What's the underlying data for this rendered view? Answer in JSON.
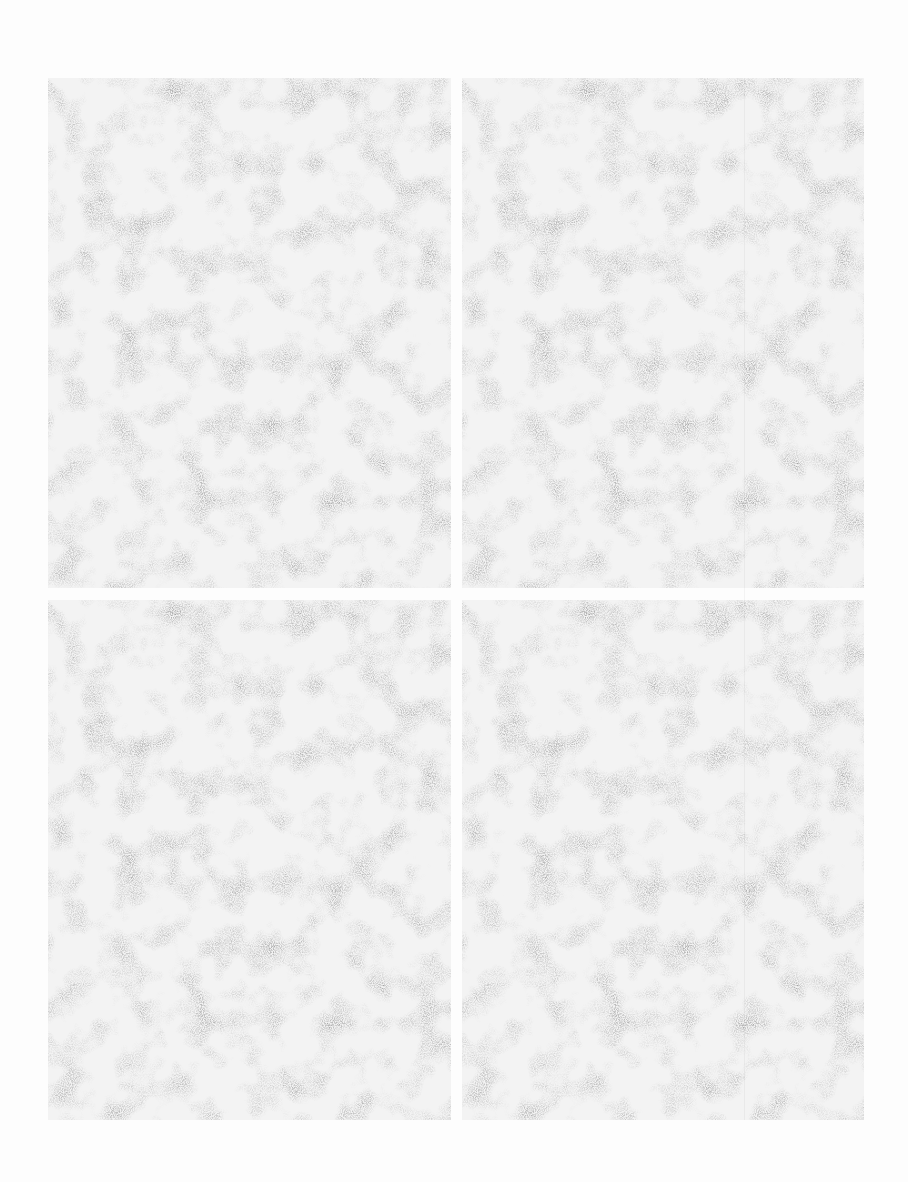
{
  "page": {
    "type": "scanned blank page",
    "layout": "2x2 grid of empty noisy panels",
    "panels": [
      {
        "id": "top-left",
        "text": ""
      },
      {
        "id": "top-right",
        "text": ""
      },
      {
        "id": "bottom-left",
        "text": ""
      },
      {
        "id": "bottom-right",
        "text": ""
      }
    ],
    "colors": {
      "background": "#fdfdfd",
      "panel": "#f3f3f3",
      "noise": "#9a9a9a"
    }
  }
}
